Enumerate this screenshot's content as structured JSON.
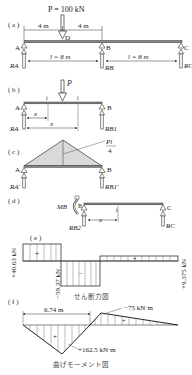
{
  "figure": {
    "panels": {
      "a": {
        "tag": "( a )",
        "load": "P = 100 kN",
        "dim_left": "4 m",
        "dim_right": "4 m",
        "span_AB": "l = 8 m",
        "span_BC": "l = 8 m",
        "point_D": "D",
        "support_A": "A",
        "support_B": "B",
        "support_C": "C",
        "reaction_A": "RA",
        "reaction_B": "RB",
        "reaction_C": "RC"
      },
      "b": {
        "tag": "( b )",
        "load": "P",
        "section_mark_1": "i",
        "section_mark_2": "i",
        "dim_x1": "x",
        "dim_x2": "x",
        "support_A": "A",
        "support_B": "B",
        "reaction_A": "RA",
        "reaction_B": "RB1"
      },
      "c": {
        "tag": "( c )",
        "peak_label_num": "Pl",
        "peak_label_den": "4",
        "support_A": "A",
        "support_B": "B",
        "reaction_A": "RA'",
        "reaction_B": "RB1'"
      },
      "d": {
        "tag": "( d )",
        "moment": "MB",
        "support_B": "B",
        "support_C": "C",
        "section_mark": "i",
        "dim_x": "x",
        "reaction_B": "RB2",
        "reaction_C": "RC"
      },
      "e": {
        "tag": "( e )",
        "value_left": "+40.63 kN",
        "value_mid": "−59.37 kN",
        "value_right": "+9.375 kN",
        "sign_pos": "+",
        "sign_neg": "−",
        "sign_pos2": "+",
        "caption": "せん断力図"
      },
      "f": {
        "tag": "( f )",
        "dim": "6.74 m",
        "value_neg": "−75 kN·m",
        "value_pos": "+162.5 kN·m",
        "sign_pos": "+",
        "sign_pos2": "+",
        "caption": "曲げモーメント図"
      }
    },
    "colors": {
      "line": "#333333",
      "fill_gray": "#d9d9d9",
      "text": "#222222"
    }
  }
}
